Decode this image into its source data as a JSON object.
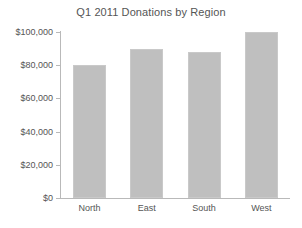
{
  "chart_data": {
    "type": "bar",
    "title": "Q1 2011 Donations by Region",
    "xlabel": "",
    "ylabel": "",
    "categories": [
      "North",
      "East",
      "South",
      "West"
    ],
    "values": [
      80000,
      90000,
      88000,
      100000
    ],
    "ylim": [
      0,
      100000
    ],
    "yticks": [
      0,
      20000,
      40000,
      60000,
      80000,
      100000
    ],
    "ytick_labels": [
      "$0",
      "$20,000",
      "$40,000",
      "$60,000",
      "$80,000",
      "$100,000"
    ],
    "grid": false,
    "legend": false,
    "bar_color": "#bfbfbf",
    "axis_color": "#b9b9b9",
    "text_color": "#555555",
    "background": "#ffffff"
  }
}
